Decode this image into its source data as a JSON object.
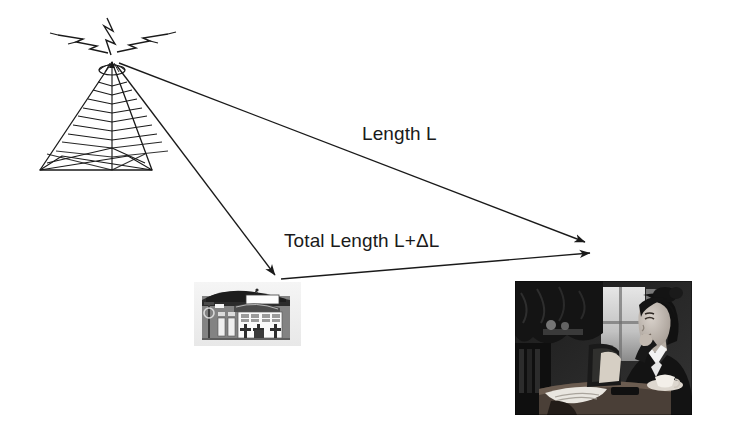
{
  "diagram": {
    "background_color": "#ffffff",
    "stroke_color": "#1a1a1a",
    "text_color": "#1a1a1a",
    "labels": {
      "direct_path": "Length L",
      "indirect_path": "Total Length L+ΔL"
    },
    "nodes": {
      "transmitter": {
        "name": "broadcast-tower",
        "apex": {
          "x": 112,
          "y": 58
        },
        "base_left": {
          "x": 40,
          "y": 170
        },
        "base_right": {
          "x": 152,
          "y": 170
        },
        "emits": "radio-waves"
      },
      "reflector": {
        "name": "building",
        "x": 194,
        "y": 282,
        "width": 107,
        "height": 64
      },
      "receiver": {
        "name": "woman-with-laptop",
        "x": 515,
        "y": 281,
        "width": 177,
        "height": 134
      }
    },
    "arrows": [
      {
        "name": "direct-path-arrow",
        "from": {
          "x": 118,
          "y": 62
        },
        "to": {
          "x": 592,
          "y": 245
        },
        "label": "Length L"
      },
      {
        "name": "tower-to-building-arrow",
        "from": {
          "x": 116,
          "y": 64
        },
        "to": {
          "x": 278,
          "y": 278
        },
        "label": ""
      },
      {
        "name": "building-to-receiver-arrow",
        "from": {
          "x": 280,
          "y": 279
        },
        "to": {
          "x": 597,
          "y": 254
        },
        "label": ""
      }
    ],
    "icons": {
      "lightning_left": "lightning-bolt-icon",
      "lightning_up": "lightning-bolt-icon",
      "lightning_right": "lightning-bolt-icon"
    }
  }
}
